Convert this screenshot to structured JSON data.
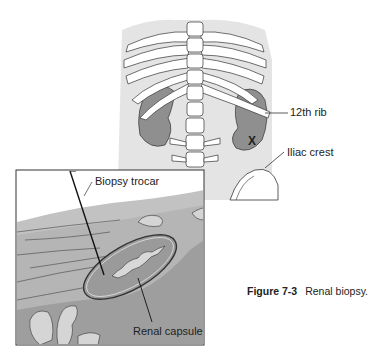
{
  "figure": {
    "number": "Figure 7-3",
    "title": "Renal biopsy."
  },
  "labels": {
    "rib": "12th rib",
    "iliac": "Iliac crest",
    "marker": "X",
    "trocar": "Biopsy trocar",
    "capsule": "Renal capsule"
  },
  "colors": {
    "body": "#e4e4e4",
    "kidney": "#8f8f8f",
    "tissue": "#a9a9a9",
    "muscle": "#c2c2c2",
    "outline": "#333333"
  }
}
